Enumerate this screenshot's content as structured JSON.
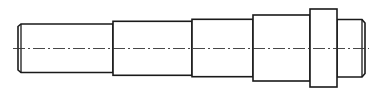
{
  "drawing": {
    "title": "Stepped shaft",
    "view": "side elevation",
    "line_color": "#1a1a1a",
    "background": "#ffffff",
    "sections": [
      {
        "id": "left-journal",
        "feature": "chamfered end"
      },
      {
        "id": "step-2"
      },
      {
        "id": "step-3"
      },
      {
        "id": "step-4"
      },
      {
        "id": "collar"
      },
      {
        "id": "right-journal",
        "feature": "chamfered end"
      }
    ],
    "centerline": "dash-dot"
  }
}
